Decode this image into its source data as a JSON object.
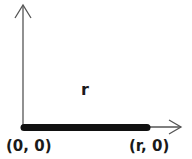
{
  "diagram": {
    "segment_label": "r",
    "origin_label": "(0, 0)",
    "endpoint_label": "(r, 0)",
    "colors": {
      "axis": "#555555",
      "segment": "#111111",
      "text": "#1a1a1a",
      "background": "#ffffff"
    }
  }
}
